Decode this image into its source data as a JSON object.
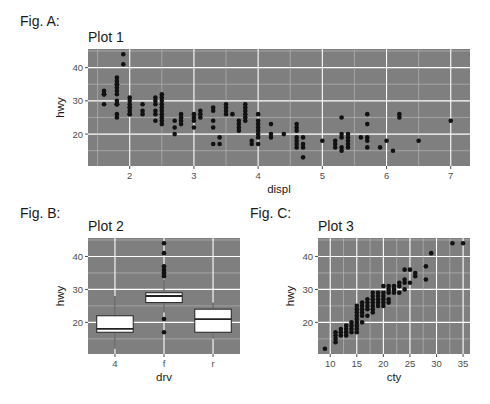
{
  "figures": [
    {
      "label": "Fig. A:",
      "title": "Plot 1"
    },
    {
      "label": "Fig. B:",
      "title": "Plot 2"
    },
    {
      "label": "Fig. C:",
      "title": "Plot 3"
    }
  ],
  "colors": {
    "panel": "#7f7f7f",
    "grid_major": "#ffffff",
    "grid_minor": "#bdbdbd",
    "point": "#111111",
    "box_fill": "#ffffff",
    "box_line": "#222222",
    "tick": "#4d4d4d"
  },
  "chart_data": [
    {
      "id": "plot1",
      "type": "scatter",
      "title": "Plot 1",
      "xlabel": "displ",
      "ylabel": "hwy",
      "xlim": [
        1.35,
        7.3
      ],
      "ylim": [
        10.4,
        45.6
      ],
      "xticks": [
        2,
        3,
        4,
        5,
        6,
        7
      ],
      "yticks": [
        20,
        30,
        40
      ],
      "grid": true,
      "points": [
        [
          1.6,
          33
        ],
        [
          1.6,
          32
        ],
        [
          1.6,
          32
        ],
        [
          1.6,
          29
        ],
        [
          1.6,
          32
        ],
        [
          1.8,
          29
        ],
        [
          1.8,
          29
        ],
        [
          1.8,
          26
        ],
        [
          1.8,
          25
        ],
        [
          1.8,
          35
        ],
        [
          1.8,
          37
        ],
        [
          1.8,
          35
        ],
        [
          1.8,
          29
        ],
        [
          1.8,
          36
        ],
        [
          1.8,
          34
        ],
        [
          1.8,
          33
        ],
        [
          1.8,
          32
        ],
        [
          1.8,
          30
        ],
        [
          1.9,
          44
        ],
        [
          1.9,
          41
        ],
        [
          2.0,
          31
        ],
        [
          2.0,
          30
        ],
        [
          2.0,
          28
        ],
        [
          2.0,
          27
        ],
        [
          2.0,
          26
        ],
        [
          2.0,
          29
        ],
        [
          2.0,
          28
        ],
        [
          2.0,
          26
        ],
        [
          2.2,
          26
        ],
        [
          2.2,
          27
        ],
        [
          2.2,
          29
        ],
        [
          2.4,
          31
        ],
        [
          2.4,
          30
        ],
        [
          2.4,
          27
        ],
        [
          2.4,
          24
        ],
        [
          2.4,
          26
        ],
        [
          2.4,
          29
        ],
        [
          2.5,
          32
        ],
        [
          2.5,
          31
        ],
        [
          2.5,
          30
        ],
        [
          2.5,
          29
        ],
        [
          2.5,
          28
        ],
        [
          2.5,
          27
        ],
        [
          2.5,
          26
        ],
        [
          2.5,
          25
        ],
        [
          2.5,
          24
        ],
        [
          2.5,
          23
        ],
        [
          2.7,
          24
        ],
        [
          2.7,
          22
        ],
        [
          2.7,
          20
        ],
        [
          2.8,
          26
        ],
        [
          2.8,
          25
        ],
        [
          2.8,
          24
        ],
        [
          2.8,
          23
        ],
        [
          3.0,
          26
        ],
        [
          3.0,
          25
        ],
        [
          3.0,
          24
        ],
        [
          3.0,
          22
        ],
        [
          3.1,
          27
        ],
        [
          3.1,
          26
        ],
        [
          3.1,
          25
        ],
        [
          3.3,
          28
        ],
        [
          3.3,
          27
        ],
        [
          3.3,
          24
        ],
        [
          3.3,
          22
        ],
        [
          3.3,
          17
        ],
        [
          3.4,
          19
        ],
        [
          3.4,
          17
        ],
        [
          3.5,
          29
        ],
        [
          3.5,
          28
        ],
        [
          3.5,
          27
        ],
        [
          3.5,
          26
        ],
        [
          3.6,
          26
        ],
        [
          3.7,
          24
        ],
        [
          3.7,
          23
        ],
        [
          3.7,
          22
        ],
        [
          3.7,
          21
        ],
        [
          3.8,
          29
        ],
        [
          3.8,
          28
        ],
        [
          3.8,
          27
        ],
        [
          3.8,
          26
        ],
        [
          3.8,
          25
        ],
        [
          3.8,
          24
        ],
        [
          3.9,
          18
        ],
        [
          3.9,
          17
        ],
        [
          4.0,
          26
        ],
        [
          4.0,
          24
        ],
        [
          4.0,
          23
        ],
        [
          4.0,
          22
        ],
        [
          4.0,
          21
        ],
        [
          4.0,
          20
        ],
        [
          4.0,
          19
        ],
        [
          4.0,
          17
        ],
        [
          4.2,
          23
        ],
        [
          4.2,
          20
        ],
        [
          4.2,
          19
        ],
        [
          4.4,
          20
        ],
        [
          4.6,
          23
        ],
        [
          4.6,
          22
        ],
        [
          4.6,
          21
        ],
        [
          4.6,
          19
        ],
        [
          4.6,
          18
        ],
        [
          4.6,
          17
        ],
        [
          4.6,
          16
        ],
        [
          4.7,
          19
        ],
        [
          4.7,
          17
        ],
        [
          4.7,
          16
        ],
        [
          4.7,
          13
        ],
        [
          5.0,
          18
        ],
        [
          5.2,
          18
        ],
        [
          5.2,
          17
        ],
        [
          5.2,
          16
        ],
        [
          5.3,
          25
        ],
        [
          5.3,
          20
        ],
        [
          5.3,
          19
        ],
        [
          5.3,
          16
        ],
        [
          5.3,
          15
        ],
        [
          5.4,
          20
        ],
        [
          5.4,
          19
        ],
        [
          5.4,
          18
        ],
        [
          5.4,
          17
        ],
        [
          5.4,
          16
        ],
        [
          5.6,
          19
        ],
        [
          5.7,
          26
        ],
        [
          5.7,
          23
        ],
        [
          5.7,
          19
        ],
        [
          5.7,
          18
        ],
        [
          5.7,
          16
        ],
        [
          5.9,
          16
        ],
        [
          6.0,
          18
        ],
        [
          6.1,
          15
        ],
        [
          6.2,
          26
        ],
        [
          6.2,
          25
        ],
        [
          6.5,
          18
        ],
        [
          7.0,
          24
        ]
      ]
    },
    {
      "id": "plot2",
      "type": "box",
      "title": "Plot 2",
      "xlabel": "drv",
      "ylabel": "hwy",
      "categories": [
        "4",
        "f",
        "r"
      ],
      "ylim": [
        10.4,
        45.6
      ],
      "yticks": [
        20,
        30,
        40
      ],
      "grid": true,
      "boxes": [
        {
          "category": "4",
          "lower_whisker": 12,
          "q1": 17,
          "median": 18,
          "q3": 22,
          "upper_whisker": 28,
          "outliers": []
        },
        {
          "category": "f",
          "lower_whisker": 23,
          "q1": 26,
          "median": 28,
          "q3": 29,
          "upper_whisker": 33,
          "outliers": [
            44,
            41,
            37,
            36,
            35,
            35,
            34,
            21,
            17
          ]
        },
        {
          "category": "r",
          "lower_whisker": 15,
          "q1": 17,
          "median": 21,
          "q3": 24,
          "upper_whisker": 26,
          "outliers": []
        }
      ]
    },
    {
      "id": "plot3",
      "type": "scatter",
      "title": "Plot 3",
      "xlabel": "cty",
      "ylabel": "hwy",
      "xlim": [
        7.7,
        36.3
      ],
      "ylim": [
        10.4,
        45.6
      ],
      "xticks": [
        10,
        15,
        20,
        25,
        30,
        35
      ],
      "yticks": [
        20,
        30,
        40
      ],
      "grid": true,
      "points": [
        [
          9,
          12
        ],
        [
          11,
          14
        ],
        [
          11,
          15
        ],
        [
          11,
          16
        ],
        [
          11,
          17
        ],
        [
          12,
          16
        ],
        [
          12,
          17
        ],
        [
          12,
          18
        ],
        [
          13,
          16
        ],
        [
          13,
          17
        ],
        [
          13,
          18
        ],
        [
          13,
          19
        ],
        [
          14,
          17
        ],
        [
          14,
          18
        ],
        [
          14,
          19
        ],
        [
          14,
          20
        ],
        [
          15,
          17
        ],
        [
          15,
          18
        ],
        [
          15,
          19
        ],
        [
          15,
          20
        ],
        [
          15,
          21
        ],
        [
          15,
          22
        ],
        [
          15,
          23
        ],
        [
          15,
          24
        ],
        [
          15,
          25
        ],
        [
          16,
          20
        ],
        [
          16,
          22
        ],
        [
          16,
          23
        ],
        [
          16,
          24
        ],
        [
          16,
          25
        ],
        [
          16,
          26
        ],
        [
          17,
          22
        ],
        [
          17,
          24
        ],
        [
          17,
          25
        ],
        [
          17,
          26
        ],
        [
          17,
          27
        ],
        [
          18,
          23
        ],
        [
          18,
          24
        ],
        [
          18,
          25
        ],
        [
          18,
          26
        ],
        [
          18,
          27
        ],
        [
          18,
          28
        ],
        [
          18,
          29
        ],
        [
          19,
          25
        ],
        [
          19,
          26
        ],
        [
          19,
          27
        ],
        [
          19,
          28
        ],
        [
          19,
          29
        ],
        [
          20,
          25
        ],
        [
          20,
          26
        ],
        [
          20,
          27
        ],
        [
          20,
          28
        ],
        [
          20,
          29
        ],
        [
          20,
          31
        ],
        [
          21,
          26
        ],
        [
          21,
          27
        ],
        [
          21,
          29
        ],
        [
          21,
          30
        ],
        [
          21,
          31
        ],
        [
          22,
          29
        ],
        [
          22,
          30
        ],
        [
          22,
          31
        ],
        [
          23,
          29
        ],
        [
          23,
          31
        ],
        [
          23,
          32
        ],
        [
          24,
          30
        ],
        [
          24,
          32
        ],
        [
          24,
          33
        ],
        [
          24,
          36
        ],
        [
          25,
          32
        ],
        [
          25,
          36
        ],
        [
          26,
          34
        ],
        [
          26,
          35
        ],
        [
          28,
          33
        ],
        [
          28,
          37
        ],
        [
          29,
          41
        ],
        [
          33,
          44
        ],
        [
          35,
          44
        ]
      ]
    }
  ]
}
